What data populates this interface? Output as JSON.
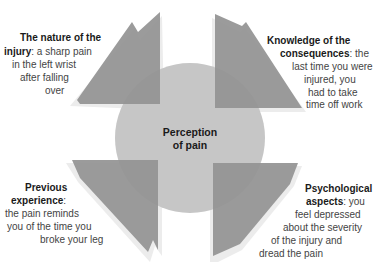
{
  "diagram": {
    "center": {
      "label_line1": "Perception",
      "label_line2": "of pain",
      "color": "#c6c6c6"
    },
    "arrow_color": "#939393",
    "shadow_color": "#e6e6e6",
    "factors": [
      {
        "position": "top-left",
        "title": "The nature of the injury",
        "lines": [
          {
            "bold": "The nature of the",
            "text": ""
          },
          {
            "bold": "injury",
            "text": ": a sharp pain"
          },
          {
            "bold": "",
            "text": "in the left wrist"
          },
          {
            "bold": "",
            "text": "after falling"
          },
          {
            "bold": "",
            "text": "over"
          }
        ]
      },
      {
        "position": "top-right",
        "title": "Knowledge of the consequences",
        "lines": [
          {
            "bold": "Knowledge of the",
            "text": ""
          },
          {
            "bold": "consequences",
            "text": ": the"
          },
          {
            "bold": "",
            "text": "last time you were"
          },
          {
            "bold": "",
            "text": "injured, you"
          },
          {
            "bold": "",
            "text": "had to take"
          },
          {
            "bold": "",
            "text": "time off work"
          }
        ]
      },
      {
        "position": "bottom-left",
        "title": "Previous experience",
        "lines": [
          {
            "bold": "Previous",
            "text": ""
          },
          {
            "bold": "experience",
            "text": ":"
          },
          {
            "bold": "",
            "text": "the pain reminds"
          },
          {
            "bold": "",
            "text": "you of the time you"
          },
          {
            "bold": "",
            "text": "broke your leg"
          }
        ]
      },
      {
        "position": "bottom-right",
        "title": "Psychological aspects",
        "lines": [
          {
            "bold": "Psychological",
            "text": ""
          },
          {
            "bold": "aspects",
            "text": ": you"
          },
          {
            "bold": "",
            "text": "feel depressed"
          },
          {
            "bold": "",
            "text": "about the severity"
          },
          {
            "bold": "",
            "text": "of the injury and"
          },
          {
            "bold": "",
            "text": "dread the pain"
          }
        ]
      }
    ]
  }
}
